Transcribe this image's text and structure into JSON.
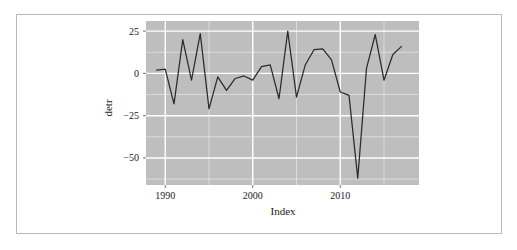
{
  "figure": {
    "background_color": "#ffffff",
    "frame_border_color": "#b9b9bd",
    "panel_color": "#bebebe",
    "grid_color": "#ffffff",
    "line_color": "#2b2b2b"
  },
  "axes": {
    "y_label": "detr",
    "x_label": "Index",
    "y_ticks": [
      "25",
      "0",
      "-25",
      "-50"
    ],
    "x_ticks": [
      "1990",
      "2000",
      "2010"
    ]
  },
  "chart_data": {
    "type": "line",
    "title": "",
    "xlabel": "Index",
    "ylabel": "detr",
    "xlim": [
      1987.8,
      2019.0
    ],
    "ylim": [
      -66,
      31
    ],
    "y_ticks": [
      25,
      0,
      -25,
      -50
    ],
    "x_ticks": [
      1990,
      2000,
      2010
    ],
    "grid": true,
    "legend": "none",
    "series": [
      {
        "name": "detr",
        "x": [
          1989,
          1990,
          1991,
          1992,
          1993,
          1994,
          1995,
          1996,
          1997,
          1998,
          1999,
          2000,
          2001,
          2002,
          2003,
          2004,
          2005,
          2006,
          2007,
          2008,
          2009,
          2010,
          2011,
          2012,
          2013,
          2014,
          2015,
          2016,
          2017
        ],
        "y": [
          2,
          2.5,
          -18,
          20,
          -4,
          23.5,
          -21,
          -2,
          -10,
          -3,
          -1.5,
          -4,
          4,
          5,
          -15,
          25,
          -14,
          5,
          14,
          14.5,
          8,
          -11,
          -13,
          -62,
          3,
          23,
          -4,
          11,
          16
        ]
      }
    ]
  }
}
